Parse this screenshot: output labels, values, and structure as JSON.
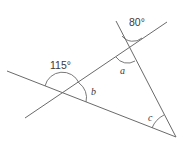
{
  "diagram": {
    "type": "geometry-angles",
    "labels": {
      "angle_top_exterior": "80°",
      "angle_left_exterior": "115°",
      "a": "a",
      "b": "b",
      "c": "c"
    },
    "lines": [
      {
        "id": "line-1",
        "from": [
          25,
          118
        ],
        "to": [
          167,
          22
        ]
      },
      {
        "id": "line-2",
        "from": [
          7,
          71
        ],
        "to": [
          176,
          137
        ]
      },
      {
        "id": "line-3",
        "from": [
          116,
          21
        ],
        "to": [
          176,
          137
        ]
      }
    ],
    "colors": {
      "stroke": "#6a6a6a",
      "text": "#3a3a3a"
    }
  }
}
